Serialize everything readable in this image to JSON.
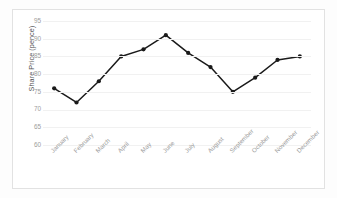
{
  "chart_data": {
    "type": "line",
    "title": "",
    "xlabel": "",
    "ylabel": "Share Price (pence)",
    "categories": [
      "January",
      "February",
      "March",
      "April",
      "May",
      "June",
      "July",
      "August",
      "September",
      "October",
      "November",
      "December"
    ],
    "values": [
      76,
      72,
      78,
      85,
      87,
      91,
      86,
      82,
      75,
      79,
      84,
      85
    ],
    "series": [
      {
        "name": "Share Price",
        "values": [
          76,
          72,
          78,
          85,
          87,
          91,
          86,
          82,
          75,
          79,
          84,
          85
        ]
      }
    ],
    "ylim": [
      60,
      95
    ],
    "yticks": [
      95,
      90,
      85,
      80,
      75,
      70,
      65,
      60
    ],
    "ytick_labels": [
      "95",
      "90",
      "85",
      "80",
      "75",
      "70",
      "65",
      "60"
    ],
    "grid": true,
    "legend": false,
    "legend_position": "none",
    "line_color": "#1a1a1a",
    "marker_color": "#1a1a1a",
    "marker_shape": "circle",
    "grid_color": "#f1f1f1",
    "background_color": "#ffffff",
    "border_color": "#e2e2e2",
    "axis_label_color": "#555555",
    "tick_label_color": "#9c9c9c"
  }
}
